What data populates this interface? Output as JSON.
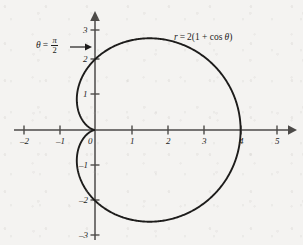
{
  "figure": {
    "kind": "polar-cardioid-plot",
    "background_color": "#f4f3f1",
    "curve_color": "#1d1c1b",
    "axis_color": "#4c4a48"
  },
  "annotations": {
    "equation_prefix": "r",
    "equation_equals": "=",
    "equation_body": "2(1 + cos",
    "equation_theta": "θ",
    "equation_close": ")",
    "equation_full": "r = 2(1 + cos θ)",
    "theta_symbol": "θ",
    "theta_equals": "=",
    "theta_numerator": "π",
    "theta_denominator": "2",
    "theta_full": "θ = π/2"
  },
  "chart_data": {
    "type": "line",
    "title": "",
    "xlabel": "",
    "ylabel": "",
    "equation": "r = 2(1 + cos θ)",
    "curve_name": "cardioid",
    "coordinate_system": "polar plotted on cartesian axes",
    "xlim": [
      -2.6,
      5.6
    ],
    "ylim": [
      -3.4,
      3.4
    ],
    "grid": false,
    "legend": "none",
    "xticks": [
      -2,
      -1,
      0,
      1,
      2,
      3,
      4,
      5
    ],
    "xtick_labels": [
      "–2",
      "–1",
      "0",
      "1",
      "2",
      "3",
      "4",
      "5"
    ],
    "yticks": [
      3,
      2,
      1,
      -1,
      -2,
      -3
    ],
    "ytick_labels": [
      "3",
      "2",
      "1",
      "–1",
      "–2",
      "–3"
    ],
    "annotations": [
      {
        "text": "r = 2(1 + cos θ)",
        "x": 2.1,
        "y": 2.75
      },
      {
        "text": "θ = π/2",
        "x": -1.35,
        "y": 2.4,
        "arrow_to": [
          0,
          2
        ]
      }
    ],
    "key_points": [
      {
        "label": "theta=0",
        "theta_deg": 0,
        "r": 4,
        "x": 4,
        "y": 0
      },
      {
        "label": "theta=pi/2",
        "theta_deg": 90,
        "r": 2,
        "x": 0,
        "y": 2
      },
      {
        "label": "theta=pi",
        "theta_deg": 180,
        "r": 0,
        "x": 0,
        "y": 0
      },
      {
        "label": "theta=3pi/2",
        "theta_deg": 270,
        "r": 2,
        "x": 0,
        "y": -2
      },
      {
        "label": "max-y",
        "theta_deg": 60,
        "r": 3,
        "x": 1.5,
        "y": 2.598
      },
      {
        "label": "min-y",
        "theta_deg": 300,
        "r": 3,
        "x": 1.5,
        "y": -2.598
      },
      {
        "label": "leftmost",
        "theta_deg": 120,
        "r": 1,
        "x": -0.5,
        "y": 0.866
      }
    ],
    "theta_samples_deg": [
      0,
      15,
      30,
      45,
      60,
      75,
      90,
      105,
      120,
      135,
      150,
      165,
      180,
      195,
      210,
      225,
      240,
      255,
      270,
      285,
      300,
      315,
      330,
      345,
      360
    ],
    "r_values": [
      4.0,
      3.932,
      3.732,
      3.414,
      3.0,
      2.518,
      2.0,
      1.482,
      1.0,
      0.586,
      0.268,
      0.068,
      0.0,
      0.068,
      0.268,
      0.586,
      1.0,
      1.482,
      2.0,
      2.518,
      3.0,
      3.414,
      3.732,
      3.932,
      4.0
    ]
  }
}
